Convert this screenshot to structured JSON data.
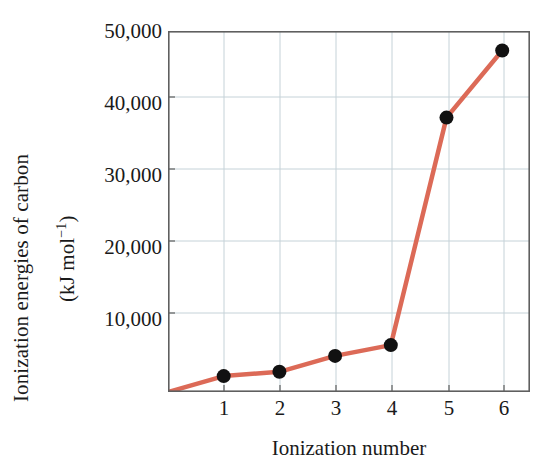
{
  "chart_data": {
    "type": "line",
    "title": "",
    "subtitle": "",
    "xlabel": "Ionization number",
    "ylabel_line1": "Ionization energies of carbon",
    "ylabel_line2": "(kJ mol⁻¹)",
    "ylabel_units": "kJ mol^-1",
    "x": [
      1,
      2,
      3,
      4,
      5,
      6
    ],
    "values": [
      2200,
      2800,
      5000,
      6500,
      38000,
      47300
    ],
    "categories": [
      "1",
      "2",
      "3",
      "4",
      "5",
      "6"
    ],
    "xtick_labels": [
      "1",
      "2",
      "3",
      "4",
      "5",
      "6"
    ],
    "ytick_labels": [
      "50,000",
      "40,000",
      "30,000",
      "20,000",
      "10,000"
    ],
    "ytick_values": [
      50000,
      40000,
      30000,
      20000,
      10000
    ],
    "xlim": [
      0,
      6.5
    ],
    "ylim": [
      0,
      50000
    ],
    "grid": true,
    "grid_x": true,
    "grid_y": true,
    "legend": "none",
    "series": [
      {
        "name": "Ionization energies of carbon",
        "values": [
          2200,
          2800,
          5000,
          6500,
          38000,
          47300
        ],
        "line_color": "#DC6A57",
        "marker_color": "#111111",
        "marker": "circle"
      }
    ],
    "annotations": [],
    "colors": {
      "line": "#DC6A57",
      "marker": "#111111",
      "frame": "#5f5f5f",
      "grid": "#c9d4d8",
      "background": "#ffffff",
      "text": "#1a1a1a"
    }
  }
}
